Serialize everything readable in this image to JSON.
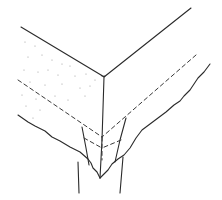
{
  "figure": {
    "line_color": "#2a2a2a",
    "background": "#ffffff",
    "stipple_color": "#9a9a9a"
  }
}
